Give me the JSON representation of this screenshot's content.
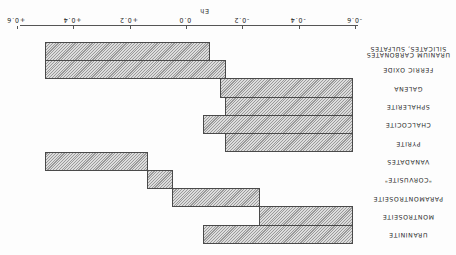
{
  "figure": {
    "orientation_note": "image rendered rotated 180 degrees",
    "axis_title": "Eh",
    "ticks": [
      "-0.6",
      "-0.4",
      "-0.2",
      "0.0",
      "+0.2",
      "+0.4",
      "+0.6"
    ]
  },
  "chart_data": {
    "type": "bar",
    "subtype": "floating-range-horizontal",
    "title": "",
    "xlabel": "Eh",
    "ylabel": "",
    "xlim": [
      -0.6,
      0.6
    ],
    "grid": false,
    "legend": null,
    "rotation_deg": 180,
    "categories": [
      "URANINITE",
      "MONTROSEITE",
      "PARAMONTROSEITE",
      "\"CORVUSITE\"",
      "VANADATES",
      "PYRITE",
      "CHALCOCITE",
      "SPHALERITE",
      "GALENA",
      "FERRIC OXIDE",
      "URANIUM CARBONATES SILICATES, SULFATES"
    ],
    "series": [
      {
        "name": "Eh range",
        "ranges": [
          [
            -0.59,
            -0.06
          ],
          [
            -0.59,
            -0.26
          ],
          [
            -0.26,
            0.05
          ],
          [
            0.05,
            0.14
          ],
          [
            0.14,
            0.5
          ],
          [
            -0.59,
            -0.14
          ],
          [
            -0.59,
            -0.06
          ],
          [
            -0.59,
            -0.14
          ],
          [
            -0.59,
            -0.12
          ],
          [
            -0.14,
            0.5
          ],
          [
            -0.08,
            0.5
          ]
        ]
      }
    ],
    "tick_labels": [
      "-0.6",
      "-0.4",
      "-0.2",
      "0.0",
      "+0.2",
      "+0.4",
      "+0.6"
    ]
  },
  "rows": [
    {
      "label_lines": [
        "URANINITE"
      ],
      "min": -0.59,
      "max": -0.06
    },
    {
      "label_lines": [
        "MONTROSEITE"
      ],
      "min": -0.59,
      "max": -0.26
    },
    {
      "label_lines": [
        "PARAMONTROSEITE"
      ],
      "min": -0.26,
      "max": 0.05
    },
    {
      "label_lines": [
        "\"CORVUSITE\""
      ],
      "min": 0.05,
      "max": 0.14
    },
    {
      "label_lines": [
        "VANADATES"
      ],
      "min": 0.14,
      "max": 0.5
    },
    {
      "label_lines": [
        "PYRITE"
      ],
      "min": -0.59,
      "max": -0.14
    },
    {
      "label_lines": [
        "CHALCOCITE"
      ],
      "min": -0.59,
      "max": -0.06
    },
    {
      "label_lines": [
        "SPHALERITE"
      ],
      "min": -0.59,
      "max": -0.14
    },
    {
      "label_lines": [
        "GALENA"
      ],
      "min": -0.59,
      "max": -0.12
    },
    {
      "label_lines": [
        "FERRIC OXIDE"
      ],
      "min": -0.14,
      "max": 0.5
    },
    {
      "label_lines": [
        "URANIUM CARBONATES",
        "SILICATES, SULFATES"
      ],
      "min": -0.08,
      "max": 0.5
    }
  ]
}
